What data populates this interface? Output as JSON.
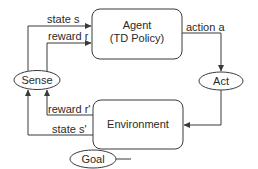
{
  "diagram": {
    "nodes": {
      "agent": {
        "line1": "Agent",
        "line2": "(TD Policy)"
      },
      "environment": {
        "label": "Environment"
      },
      "sense": {
        "label": "Sense"
      },
      "act": {
        "label": "Act"
      },
      "goal": {
        "label": "Goal"
      }
    },
    "edges": {
      "state_s": "state s",
      "reward_r": "reward r",
      "action_a": "action a",
      "reward_r_prime": "reward r'",
      "state_s_prime": "state s'"
    },
    "colors": {
      "stroke": "#3a3a3a",
      "text": "#2a2a2a",
      "background": "#ffffff"
    }
  }
}
